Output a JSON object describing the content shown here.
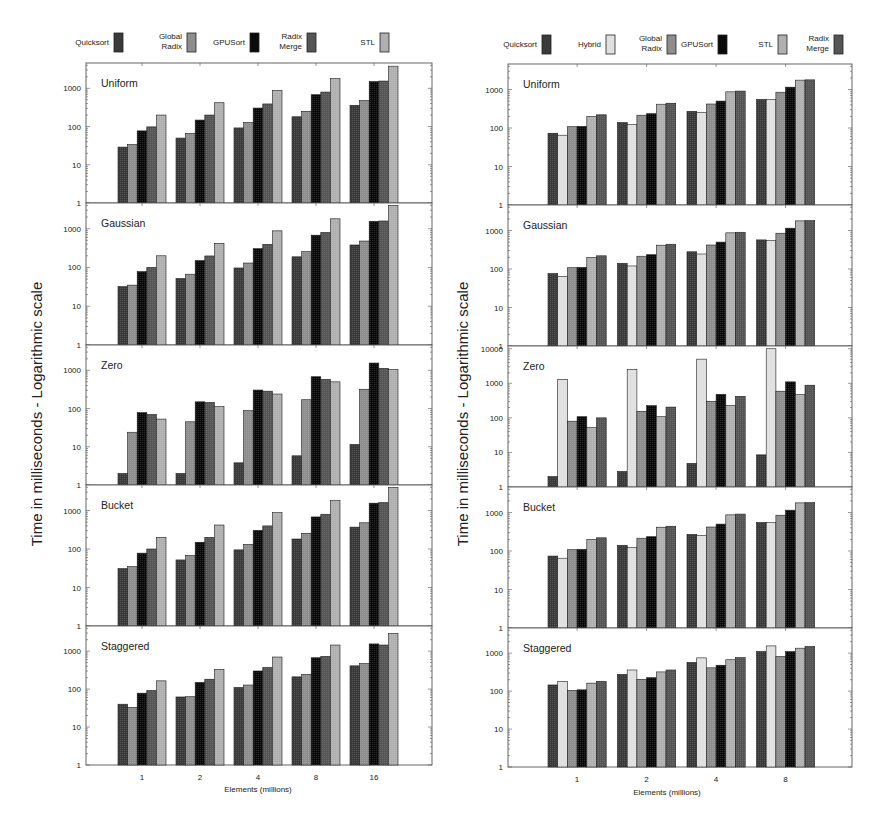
{
  "figure": {
    "ylabel": "Time in milliseconds - Logarithmic scale",
    "xlabel": "Elements (millions)"
  },
  "colors": {
    "Quicksort": "#3a3a3a",
    "Global Radix": "#8e8e8e",
    "GPUSort": "#0a0a0a",
    "Radix Merge": "#555555",
    "STL": "#b0b0b0",
    "Hybrid": "#e0e0e0"
  },
  "chart_data": [
    {
      "type": "bar",
      "title": "Left figure",
      "xlabel": "Elements (millions)",
      "ylabel": "Time in milliseconds - Logarithmic scale",
      "yscale": "log",
      "categories": [
        "1",
        "2",
        "4",
        "8",
        "16"
      ],
      "legend": [
        {
          "name": "Quicksort",
          "lines": [
            "Quicksort"
          ]
        },
        {
          "name": "Global Radix",
          "lines": [
            "Global",
            "Radix"
          ]
        },
        {
          "name": "GPUSort",
          "lines": [
            "GPUSort"
          ]
        },
        {
          "name": "Radix Merge",
          "lines": [
            "Radix",
            "Merge"
          ]
        },
        {
          "name": "STL",
          "lines": [
            "STL"
          ]
        }
      ],
      "legend_position": "top",
      "panels": [
        {
          "title": "Uniform",
          "ylim": [
            1,
            4600
          ],
          "yticks": [
            "1",
            "10",
            "100",
            "1000"
          ],
          "series": [
            {
              "name": "Quicksort",
              "values": [
                29,
                50,
                92,
                180,
                360
              ]
            },
            {
              "name": "Global Radix",
              "values": [
                34,
                66,
                128,
                250,
                480
              ]
            },
            {
              "name": "GPUSort",
              "values": [
                77,
                148,
                305,
                680,
                1500
              ]
            },
            {
              "name": "Radix Merge",
              "values": [
                98,
                200,
                390,
                800,
                1550
              ]
            },
            {
              "name": "STL",
              "values": [
                200,
                420,
                880,
                1800,
                3800
              ]
            }
          ]
        },
        {
          "title": "Gaussian",
          "ylim": [
            1,
            4600
          ],
          "yticks": [
            "1",
            "10",
            "100",
            "1000"
          ],
          "series": [
            {
              "name": "Quicksort",
              "values": [
                32,
                52,
                97,
                188,
                380
              ]
            },
            {
              "name": "Global Radix",
              "values": [
                35,
                67,
                130,
                255,
                480
              ]
            },
            {
              "name": "GPUSort",
              "values": [
                78,
                150,
                305,
                680,
                1550
              ]
            },
            {
              "name": "Radix Merge",
              "values": [
                100,
                198,
                395,
                800,
                1580
              ]
            },
            {
              "name": "STL",
              "values": [
                200,
                420,
                880,
                1800,
                4000
              ]
            }
          ]
        },
        {
          "title": "Zero",
          "ylim": [
            1,
            4600
          ],
          "yticks": [
            "1",
            "10",
            "100",
            "1000"
          ],
          "series": [
            {
              "name": "Quicksort",
              "values": [
                2,
                2,
                3.8,
                5.8,
                11.5
              ]
            },
            {
              "name": "Global Radix",
              "values": [
                24,
                45,
                88,
                170,
                320
              ]
            },
            {
              "name": "GPUSort",
              "values": [
                78,
                150,
                305,
                680,
                1550
              ]
            },
            {
              "name": "Radix Merge",
              "values": [
                70,
                145,
                285,
                580,
                1130
              ]
            },
            {
              "name": "STL",
              "values": [
                53,
                112,
                240,
                500,
                1050
              ]
            }
          ]
        },
        {
          "title": "Bucket",
          "ylim": [
            1,
            4600
          ],
          "yticks": [
            "1",
            "10",
            "100",
            "1000"
          ],
          "series": [
            {
              "name": "Quicksort",
              "values": [
                31,
                52,
                95,
                182,
                370
              ]
            },
            {
              "name": "Global Radix",
              "values": [
                35,
                68,
                132,
                255,
                480
              ]
            },
            {
              "name": "GPUSort",
              "values": [
                78,
                150,
                305,
                680,
                1550
              ]
            },
            {
              "name": "Radix Merge",
              "values": [
                100,
                200,
                398,
                800,
                1600
              ]
            },
            {
              "name": "STL",
              "values": [
                200,
                420,
                880,
                1800,
                4000
              ]
            }
          ]
        },
        {
          "title": "Staggered",
          "ylim": [
            1,
            4600
          ],
          "yticks": [
            "1",
            "10",
            "100",
            "1000"
          ],
          "series": [
            {
              "name": "Quicksort",
              "values": [
                40,
                62,
                110,
                210,
                410
              ]
            },
            {
              "name": "Global Radix",
              "values": [
                33,
                63,
                128,
                245,
                470
              ]
            },
            {
              "name": "GPUSort",
              "values": [
                78,
                150,
                300,
                670,
                1550
              ]
            },
            {
              "name": "Radix Merge",
              "values": [
                92,
                182,
                370,
                730,
                1450
              ]
            },
            {
              "name": "STL",
              "values": [
                165,
                330,
                700,
                1450,
                2900
              ]
            }
          ]
        }
      ]
    },
    {
      "type": "bar",
      "title": "Right figure",
      "xlabel": "Elements (millions)",
      "ylabel": "Time in milliseconds - Logarithmic scale",
      "yscale": "log",
      "categories": [
        "1",
        "2",
        "4",
        "8"
      ],
      "legend": [
        {
          "name": "Quicksort",
          "lines": [
            "Quicksort"
          ]
        },
        {
          "name": "Hybrid",
          "lines": [
            "Hybrid"
          ]
        },
        {
          "name": "Global Radix",
          "lines": [
            "Global",
            "Radix"
          ]
        },
        {
          "name": "GPUSort",
          "lines": [
            "GPUSort"
          ]
        },
        {
          "name": "STL",
          "lines": [
            "STL"
          ]
        },
        {
          "name": "Radix Merge",
          "lines": [
            "Radix",
            "Merge"
          ]
        }
      ],
      "legend_position": "top",
      "panels": [
        {
          "title": "Uniform",
          "ylim": [
            1,
            4600
          ],
          "yticks": [
            "1",
            "10",
            "100",
            "1000"
          ],
          "series": [
            {
              "name": "Quicksort",
              "values": [
                73,
                138,
                270,
                550
              ]
            },
            {
              "name": "Hybrid",
              "values": [
                65,
                122,
                250,
                545
              ]
            },
            {
              "name": "Global Radix",
              "values": [
                108,
                215,
                420,
                850
              ]
            },
            {
              "name": "GPUSort",
              "values": [
                110,
                235,
                500,
                1150
              ]
            },
            {
              "name": "STL",
              "values": [
                200,
                415,
                870,
                1750
              ]
            },
            {
              "name": "Radix Merge",
              "values": [
                220,
                440,
                910,
                1780
              ]
            }
          ]
        },
        {
          "title": "Gaussian",
          "ylim": [
            1,
            4600
          ],
          "yticks": [
            "1",
            "10",
            "100",
            "1000"
          ],
          "series": [
            {
              "name": "Quicksort",
              "values": [
                76,
                140,
                280,
                570
              ]
            },
            {
              "name": "Hybrid",
              "values": [
                64,
                120,
                245,
                545
              ]
            },
            {
              "name": "Global Radix",
              "values": [
                108,
                215,
                420,
                850
              ]
            },
            {
              "name": "GPUSort",
              "values": [
                110,
                235,
                500,
                1150
              ]
            },
            {
              "name": "STL",
              "values": [
                200,
                415,
                870,
                1780
              ]
            },
            {
              "name": "Radix Merge",
              "values": [
                220,
                440,
                900,
                1800
              ]
            }
          ]
        },
        {
          "title": "Zero",
          "ylim": [
            1,
            12000
          ],
          "yticks": [
            "1",
            "10",
            "100",
            "1000",
            "10000"
          ],
          "series": [
            {
              "name": "Quicksort",
              "values": [
                2,
                2.8,
                4.8,
                8.5
              ]
            },
            {
              "name": "Hybrid",
              "values": [
                1300,
                2500,
                5000,
                10000
              ]
            },
            {
              "name": "Global Radix",
              "values": [
                80,
                155,
                300,
                590
              ]
            },
            {
              "name": "GPUSort",
              "values": [
                108,
                225,
                480,
                1100
              ]
            },
            {
              "name": "STL",
              "values": [
                52,
                108,
                225,
                470
              ]
            },
            {
              "name": "Radix Merge",
              "values": [
                100,
                205,
                420,
                880
              ]
            }
          ]
        },
        {
          "title": "Bucket",
          "ylim": [
            1,
            4600
          ],
          "yticks": [
            "1",
            "10",
            "100",
            "1000"
          ],
          "series": [
            {
              "name": "Quicksort",
              "values": [
                74,
                140,
                270,
                550
              ]
            },
            {
              "name": "Hybrid",
              "values": [
                65,
                122,
                250,
                545
              ]
            },
            {
              "name": "Global Radix",
              "values": [
                108,
                215,
                420,
                850
              ]
            },
            {
              "name": "GPUSort",
              "values": [
                110,
                235,
                500,
                1150
              ]
            },
            {
              "name": "STL",
              "values": [
                200,
                415,
                870,
                1780
              ]
            },
            {
              "name": "Radix Merge",
              "values": [
                220,
                440,
                910,
                1800
              ]
            }
          ]
        },
        {
          "title": "Staggered",
          "ylim": [
            1,
            4600
          ],
          "yticks": [
            "1",
            "10",
            "100",
            "1000"
          ],
          "series": [
            {
              "name": "Quicksort",
              "values": [
                145,
                275,
                570,
                1100
              ]
            },
            {
              "name": "Hybrid",
              "values": [
                180,
                360,
                750,
                1550
              ]
            },
            {
              "name": "Global Radix",
              "values": [
                105,
                205,
                410,
                820
              ]
            },
            {
              "name": "GPUSort",
              "values": [
                108,
                225,
                480,
                1100
              ]
            },
            {
              "name": "STL",
              "values": [
                162,
                320,
                670,
                1350
              ]
            },
            {
              "name": "Radix Merge",
              "values": [
                180,
                360,
                760,
                1500
              ]
            }
          ]
        }
      ]
    }
  ]
}
